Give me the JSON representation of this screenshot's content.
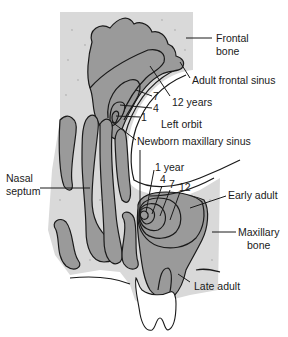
{
  "diagram": {
    "labels": {
      "frontal_bone": [
        "Frontal",
        "bone"
      ],
      "adult_frontal_sinus": "Adult frontal sinus",
      "twelve_years": "12 years",
      "seven": "7",
      "four": "4",
      "one": "1",
      "left_orbit": "Left orbit",
      "newborn_maxillary_sinus": "Newborn maxillary sinus",
      "nasal_septum": [
        "Nasal",
        "septum"
      ],
      "one_year": "1 year",
      "max_four": "4",
      "max_seven": "7",
      "max_twelve": "12",
      "early_adult": "Early adult",
      "maxillary_bone": [
        "Maxillary",
        "bone"
      ],
      "late_adult": "Late adult"
    },
    "colors": {
      "bone": "#d9d9d9",
      "sinus": "#9a9a9a",
      "outline": "#1a1a1a",
      "background": "#ffffff"
    }
  }
}
